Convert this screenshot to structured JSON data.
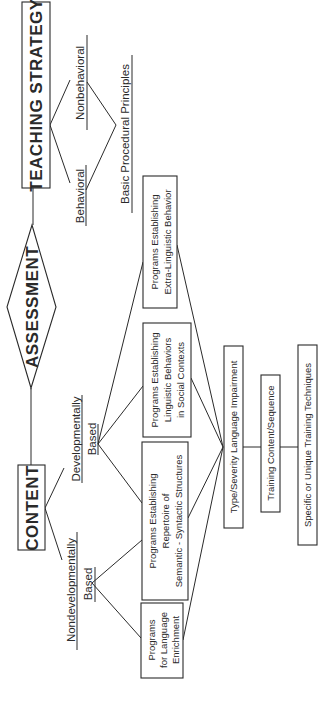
{
  "diagram": {
    "orientation": "rotated 90° counter-clockwise",
    "nodes": {
      "teaching_strategy": "TEACHING STRATEGY",
      "assessment": "ASSESSMENT",
      "content": "CONTENT",
      "behavioral": "Behavioral",
      "nonbehavioral": "Nonbehavioral",
      "basic_procedural_principles": "Basic Procedural Principles",
      "developmentally": "Developmentally",
      "developmentally_based": "Based",
      "nondevelopmentally": "Nondevelopmentally",
      "nondevelopmentally_based": "Based",
      "extra_linguistic": [
        "Programs Establishing",
        "Extra-Linguistic Behavior"
      ],
      "linguistic_social": [
        "Programs Establishing",
        "Linguistic Behaviors",
        "in Social Contexts"
      ],
      "semantic_syntactic": [
        "Programs Establishing",
        "Repertoire of",
        "Semantic - Syntactic Structures"
      ],
      "language_enrichment": [
        "Programs",
        "for Language",
        "Enrichment"
      ],
      "type_severity": "Type/Severity Language Impairment",
      "training_content": "Training Content/Sequence",
      "specific_techniques": "Specific or Unique Training Techniques"
    },
    "colors": {
      "ink": "#2a2a2a",
      "background": "#ffffff"
    }
  }
}
